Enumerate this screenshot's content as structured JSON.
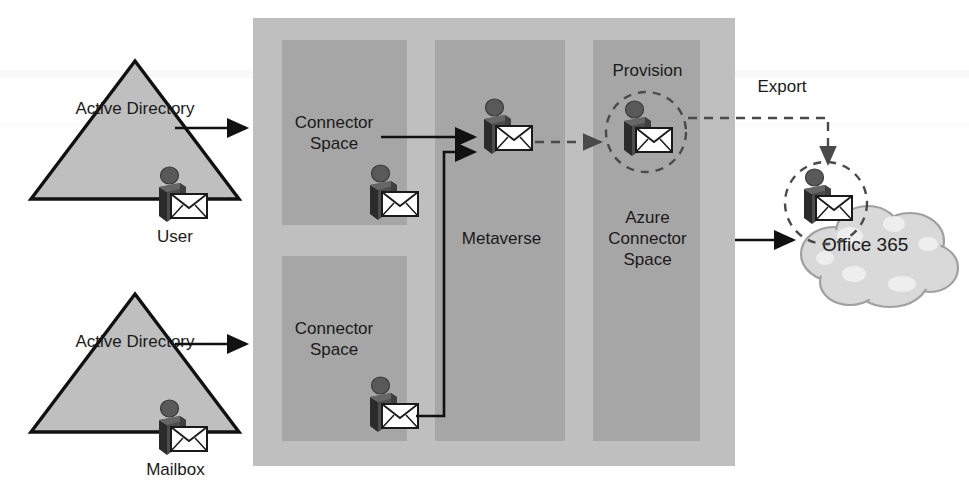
{
  "diagram": {
    "colors": {
      "sync_box_fill": "#bfbfbf",
      "column_fill": "#a6a6a6",
      "triangle_fill": "#bfbfbf",
      "triangle_stroke": "#111111",
      "cloud_fill": "#d9d9d9",
      "cloud_stroke": "#8c8c8c",
      "person_body": "#4d4d4d",
      "person_side": "#2b2b2b",
      "envelope_fill": "#ffffff",
      "arrow_solid": "#111111",
      "arrow_dashed": "#4a4a4a",
      "text": "#1a1a1a"
    }
  },
  "sources": [
    {
      "id": "user-source",
      "shape_label": "Active\nDirectory",
      "object_label": "User",
      "icon": "person-envelope-icon"
    },
    {
      "id": "mailbox-source",
      "shape_label": "Active\nDirectory",
      "object_label": "Mailbox",
      "icon": "person-envelope-icon"
    }
  ],
  "sync_engine": {
    "columns": [
      {
        "id": "connector-space-user",
        "label": "Connector\nSpace"
      },
      {
        "id": "metaverse",
        "label": "Metaverse"
      },
      {
        "id": "azure-connector-space",
        "label": "Azure\nConnector\nSpace"
      },
      {
        "id": "connector-space-mailbox",
        "label": "Connector\nSpace"
      }
    ]
  },
  "annotations": [
    {
      "id": "provision-label",
      "label": "Provision"
    },
    {
      "id": "export-label",
      "label": "Export"
    }
  ],
  "target": {
    "id": "office365-cloud",
    "label": "Office 365",
    "icon": "cloud-icon"
  },
  "objects": [
    {
      "id": "obj-user-ad",
      "icon": "person-envelope-icon"
    },
    {
      "id": "obj-mailbox-ad",
      "icon": "person-envelope-icon"
    },
    {
      "id": "obj-connector-user",
      "icon": "person-envelope-icon"
    },
    {
      "id": "obj-connector-mbx",
      "icon": "person-envelope-icon"
    },
    {
      "id": "obj-metaverse",
      "icon": "person-envelope-icon"
    },
    {
      "id": "obj-provisioned",
      "icon": "person-envelope-icon"
    },
    {
      "id": "obj-exported",
      "icon": "person-envelope-icon"
    }
  ],
  "flows": [
    {
      "id": "flow-user-to-cs",
      "style": "solid",
      "label": ""
    },
    {
      "id": "flow-mailbox-to-cs",
      "style": "solid",
      "label": ""
    },
    {
      "id": "flow-cs-to-metaverse",
      "style": "solid",
      "label": ""
    },
    {
      "id": "flow-cs2-to-metaverse",
      "style": "solid",
      "label": ""
    },
    {
      "id": "flow-metaverse-to-azure",
      "style": "dashed",
      "label": "Provision"
    },
    {
      "id": "flow-azure-to-cloud",
      "style": "dashed",
      "label": "Export"
    },
    {
      "id": "flow-azure-to-office365",
      "style": "solid",
      "label": ""
    }
  ]
}
